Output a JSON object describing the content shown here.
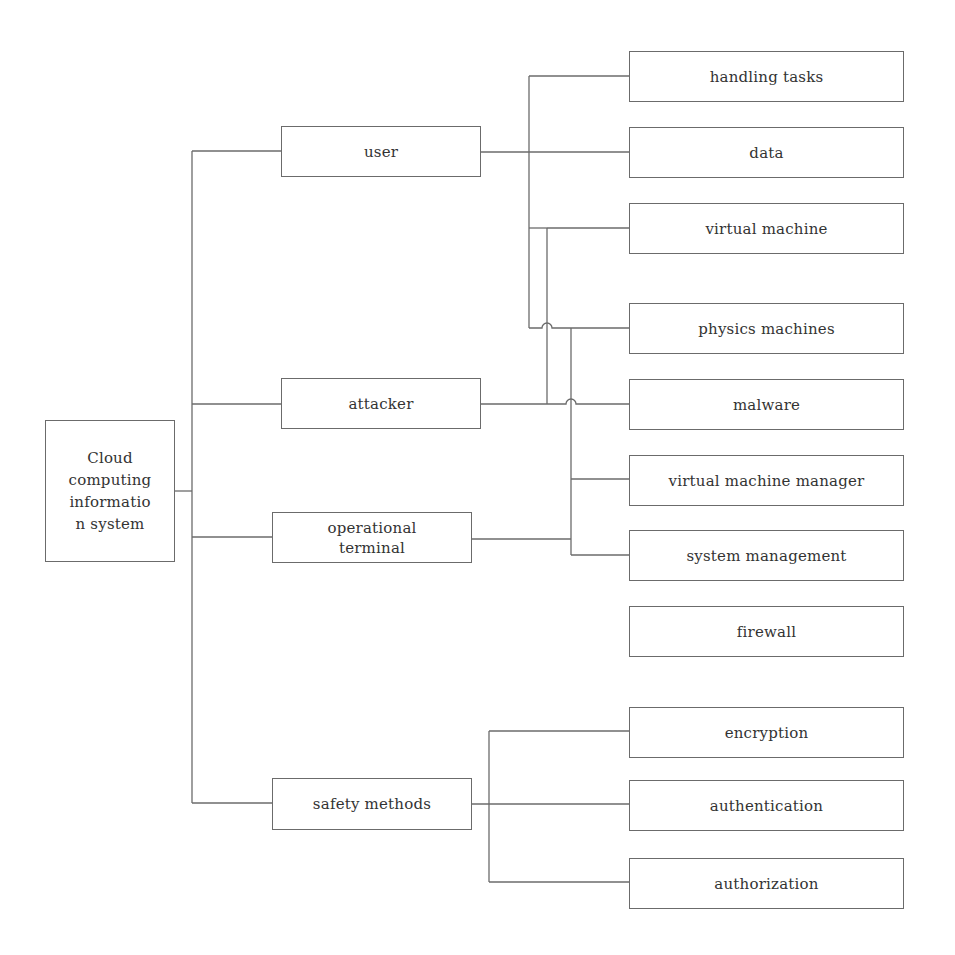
{
  "diagram": {
    "root": {
      "label": "Cloud\ncomputing\ninformatio\nn system"
    },
    "level1": [
      {
        "id": "user",
        "label": "user"
      },
      {
        "id": "attacker",
        "label": "attacker"
      },
      {
        "id": "operational-terminal",
        "label": "operational\nterminal"
      },
      {
        "id": "safety-methods",
        "label": "safety methods"
      }
    ],
    "level2": [
      {
        "id": "handling-tasks",
        "label": "handling tasks"
      },
      {
        "id": "data",
        "label": "data"
      },
      {
        "id": "virtual-machine",
        "label": "virtual machine"
      },
      {
        "id": "physics-machines",
        "label": "physics machines"
      },
      {
        "id": "malware",
        "label": "malware"
      },
      {
        "id": "virtual-machine-manager",
        "label": "virtual machine manager"
      },
      {
        "id": "system-management",
        "label": "system management"
      },
      {
        "id": "firewall",
        "label": "firewall"
      },
      {
        "id": "encryption",
        "label": "encryption"
      },
      {
        "id": "authentication",
        "label": "authentication"
      },
      {
        "id": "authorization",
        "label": "authorization"
      }
    ],
    "edges": [
      [
        "Cloud computing information system",
        "user"
      ],
      [
        "Cloud computing information system",
        "attacker"
      ],
      [
        "Cloud computing information system",
        "operational terminal"
      ],
      [
        "Cloud computing information system",
        "safety methods"
      ],
      [
        "user",
        "handling tasks"
      ],
      [
        "user",
        "data"
      ],
      [
        "user",
        "virtual machine"
      ],
      [
        "user",
        "physics machines"
      ],
      [
        "attacker",
        "virtual machine"
      ],
      [
        "attacker",
        "physics machines"
      ],
      [
        "attacker",
        "malware"
      ],
      [
        "operational terminal",
        "physics machines"
      ],
      [
        "operational terminal",
        "virtual machine manager"
      ],
      [
        "operational terminal",
        "system management"
      ],
      [
        "safety methods",
        "encryption"
      ],
      [
        "safety methods",
        "authentication"
      ],
      [
        "safety methods",
        "authorization"
      ]
    ],
    "colors": {
      "line": "#6b6b6b",
      "text": "#333333",
      "background": "#ffffff"
    }
  }
}
